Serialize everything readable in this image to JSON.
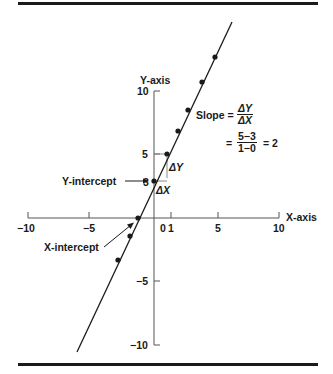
{
  "diagram": {
    "y_axis_label": "Y-axis",
    "x_axis_label": "X-axis",
    "y_ticks": [
      {
        "value": 10,
        "label": "10"
      },
      {
        "value": 5,
        "label": "5"
      },
      {
        "value": 3,
        "label": "3"
      },
      {
        "value": -5,
        "label": "−5"
      },
      {
        "value": -10,
        "label": "−10"
      }
    ],
    "x_ticks": [
      {
        "value": -10,
        "label": "−10"
      },
      {
        "value": -5,
        "label": "−5"
      },
      {
        "value": 0,
        "label": "0"
      },
      {
        "value": 1,
        "label": "1"
      },
      {
        "value": 5,
        "label": "5"
      },
      {
        "value": 10,
        "label": "10"
      }
    ],
    "y_intercept_label": "Y-intercept",
    "x_intercept_label": "X-intercept",
    "delta_y": "ΔY",
    "delta_x": "ΔX",
    "slope": {
      "label": "Slope =",
      "num1": "ΔY",
      "den1": "ΔX",
      "eq": "=",
      "num2": "5−3",
      "den2": "1−0",
      "result": "= 2"
    },
    "line_equation": "y = 2x + 3",
    "points": [
      [
        -3,
        -3
      ],
      [
        -2,
        -1
      ],
      [
        -1.5,
        0
      ],
      [
        0,
        3
      ],
      [
        1,
        5
      ],
      [
        2,
        7
      ],
      [
        3,
        9
      ],
      [
        4,
        11
      ],
      [
        5,
        13
      ]
    ]
  }
}
